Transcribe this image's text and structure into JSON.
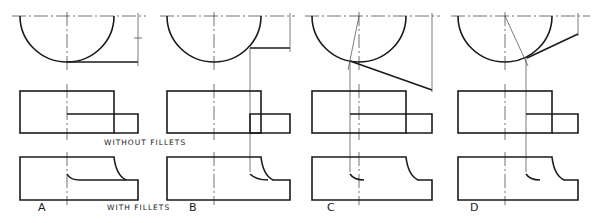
{
  "figure": {
    "caption_without": "WITHOUT FILLETS",
    "caption_with": "WITH FILLETS",
    "colors": {
      "ink": "#1a1a1a",
      "background": "#ffffff",
      "construction": "#444444"
    }
  },
  "panels": [
    {
      "id": "A",
      "label": "A"
    },
    {
      "id": "B",
      "label": "B"
    },
    {
      "id": "C",
      "label": "C"
    },
    {
      "id": "D",
      "label": "D"
    }
  ]
}
